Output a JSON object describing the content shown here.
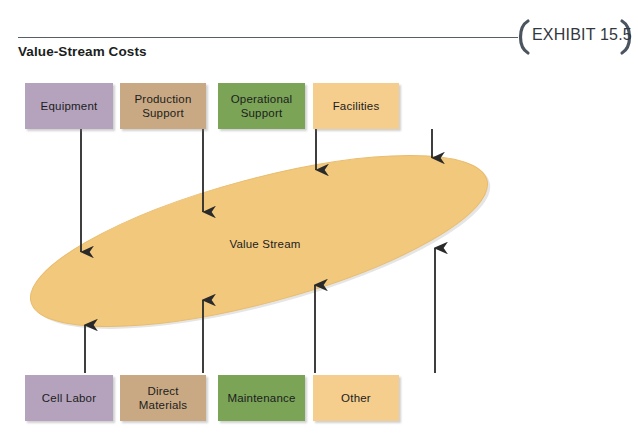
{
  "exhibit": {
    "label": "EXHIBIT 15.5",
    "title": "Value-Stream Costs"
  },
  "center": {
    "label": "Value Stream",
    "fill": "#f2c87c",
    "stroke": "#e8bd6d"
  },
  "top_boxes": [
    {
      "label": "Equipment",
      "color": "#b5a3be",
      "x": 25,
      "y": 83,
      "w": 88,
      "h": 46,
      "arrow_x": 81,
      "arrow_y2": 252
    },
    {
      "label": "Production\nSupport",
      "color": "#c9a983",
      "x": 120,
      "y": 83,
      "w": 86,
      "h": 46,
      "arrow_x": 203,
      "arrow_y2": 212
    },
    {
      "label": "Operational\nSupport",
      "color": "#7ba457",
      "x": 218,
      "y": 83,
      "w": 87,
      "h": 46,
      "arrow_x": 316,
      "arrow_y2": 170
    },
    {
      "label": "Facilities",
      "color": "#f5cd8d",
      "x": 313,
      "y": 83,
      "w": 86,
      "h": 46,
      "arrow_x": 432,
      "arrow_y2": 158
    }
  ],
  "bottom_boxes": [
    {
      "label": "Cell Labor",
      "color": "#b5a3be",
      "x": 25,
      "y": 375,
      "w": 88,
      "h": 46,
      "arrow_x": 85,
      "arrow_y2": 325
    },
    {
      "label": "Direct\nMaterials",
      "color": "#c9a983",
      "x": 120,
      "y": 375,
      "w": 86,
      "h": 46,
      "arrow_x": 203,
      "arrow_y2": 300
    },
    {
      "label": "Maintenance",
      "color": "#7ba457",
      "x": 218,
      "y": 375,
      "w": 87,
      "h": 46,
      "arrow_x": 315,
      "arrow_y2": 285
    },
    {
      "label": "Other",
      "color": "#f5cd8d",
      "x": 313,
      "y": 375,
      "w": 86,
      "h": 46,
      "arrow_x": 435,
      "arrow_y2": 248
    }
  ],
  "arrows": {
    "color": "#2a2a2a",
    "top_start_y": 129,
    "bottom_start_y": 373
  }
}
